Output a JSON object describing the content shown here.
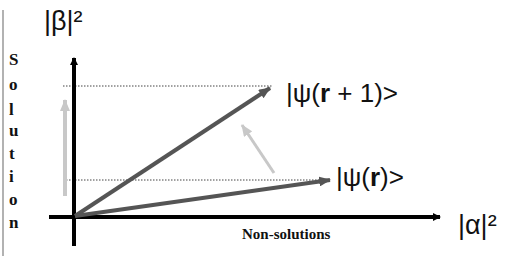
{
  "diagram": {
    "y_axis_label": "|β|²",
    "x_axis_label": "|α|²",
    "y_axis_title_letters": [
      "S",
      "o",
      "l",
      "u",
      "t",
      "i",
      "o",
      "n"
    ],
    "x_axis_title": "Non-solutions",
    "vectors": [
      {
        "label_prefix": "|ψ(",
        "label_bold": "r",
        "label_suffix": ")>",
        "color": "#555555"
      },
      {
        "label_prefix": "|ψ(",
        "label_bold": "r",
        "label_suffix": " + 1)>",
        "color": "#555555"
      }
    ],
    "colors": {
      "axis": "#000000",
      "vector": "#555555",
      "rotation_arrow": "#c8c8c8",
      "dotted": "#444444",
      "frame_line": "#999999"
    }
  }
}
